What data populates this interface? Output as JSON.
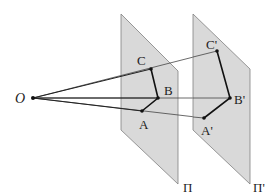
{
  "diagram": {
    "type": "central-projection",
    "colors": {
      "plane_fill": "#d9d9d9",
      "plane_stroke": "#808080",
      "line": "#333333",
      "thin_line": "#555555",
      "point": "#111111",
      "text": "#222222",
      "background": "#ffffff"
    },
    "center": {
      "label": "O",
      "x": 33,
      "y": 98
    },
    "planes": [
      {
        "label": "Π",
        "points": "121,14 178,71 178,184 121,130",
        "label_x": 183,
        "label_y": 192
      },
      {
        "label": "Π'",
        "points": "193,14 250,69 250,184 193,130",
        "label_x": 253,
        "label_y": 192
      }
    ],
    "points": {
      "A": {
        "label": "A",
        "x": 142,
        "y": 111,
        "label_x": 141,
        "label_y": 129
      },
      "B": {
        "label": "B",
        "x": 158,
        "y": 98,
        "label_x": 165,
        "label_y": 94
      },
      "C": {
        "label": "C",
        "x": 151,
        "y": 69,
        "label_x": 137,
        "label_y": 65
      },
      "A2": {
        "label": "A'",
        "x": 204,
        "y": 118,
        "label_x": 202,
        "label_y": 135
      },
      "B2": {
        "label": "B'",
        "x": 230,
        "y": 98,
        "label_x": 234,
        "label_y": 103
      },
      "C2": {
        "label": "C'",
        "x": 217,
        "y": 51,
        "label_x": 207,
        "label_y": 49
      }
    }
  }
}
